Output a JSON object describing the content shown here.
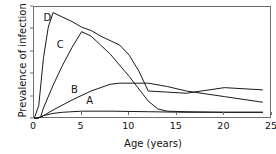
{
  "chart_data": {
    "type": "line",
    "title": "",
    "xlabel": "Age (years)",
    "ylabel": "Prevalence of infection",
    "xlim": [
      0,
      25
    ],
    "ylim": [
      0,
      100
    ],
    "xticks": [
      0,
      5,
      10,
      15,
      20,
      25
    ],
    "yticks": [
      0,
      20,
      40,
      60,
      80,
      100
    ],
    "grid": false,
    "legend_position": "inline-labels",
    "line_color": "#1a1a1a",
    "series": [
      {
        "name": "A",
        "label": "A",
        "label_x": 5.6,
        "label_y": 14,
        "x": [
          0,
          0.5,
          1,
          2,
          3,
          5,
          8,
          12,
          16,
          20,
          24
        ],
        "y": [
          0,
          1,
          3,
          5,
          6,
          7,
          7,
          6.5,
          6,
          6,
          6
        ]
      },
      {
        "name": "B",
        "label": "B",
        "label_x": 4.0,
        "label_y": 24,
        "x": [
          0,
          0.5,
          1,
          2,
          4,
          6,
          8,
          9,
          12,
          14,
          16,
          20,
          24
        ],
        "y": [
          0,
          1,
          3,
          8,
          17,
          25,
          31,
          32,
          32,
          29,
          25,
          20,
          15
        ]
      },
      {
        "name": "C",
        "label": "C",
        "label_x": 2.5,
        "label_y": 64,
        "x": [
          0,
          0.7,
          1,
          2,
          3,
          4,
          5,
          6,
          7,
          8,
          10,
          12,
          13,
          14,
          16,
          20,
          24
        ],
        "y": [
          0,
          2,
          10,
          30,
          48,
          64,
          78,
          74,
          66,
          58,
          38,
          16,
          9,
          7,
          6.5,
          6,
          6
        ]
      },
      {
        "name": "D",
        "label": "D",
        "label_x": 1.1,
        "label_y": 88,
        "x": [
          0,
          0.5,
          1,
          1.5,
          2,
          3,
          4,
          5,
          6,
          7,
          8,
          9,
          10,
          11,
          12,
          14,
          16,
          20,
          24
        ],
        "y": [
          0,
          12,
          55,
          82,
          95,
          91,
          87,
          82,
          79,
          74,
          70,
          66,
          57,
          43,
          25,
          24,
          23,
          28,
          26
        ]
      }
    ]
  }
}
